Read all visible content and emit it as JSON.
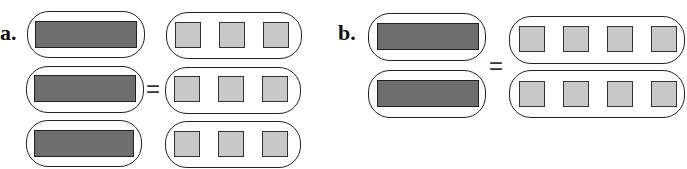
{
  "parts": [
    {
      "label": "a.",
      "left_groups": 3,
      "right_groups": 3,
      "units_per_right_group": 3,
      "equals": "="
    },
    {
      "label": "b.",
      "left_groups": 2,
      "right_groups": 2,
      "units_per_right_group": 4,
      "equals": "="
    }
  ],
  "colors": {
    "bar_fill": "#6e6e6e",
    "unit_fill": "#c8c8c8",
    "outline": "#222222"
  }
}
